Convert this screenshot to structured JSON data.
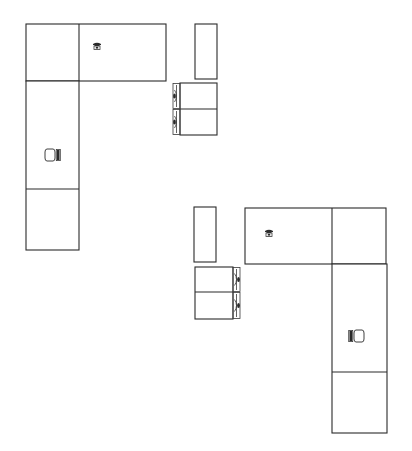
{
  "diagram": {
    "type": "office-floor-plan",
    "canvas": {
      "width": 412,
      "height": 451,
      "background": "#ffffff",
      "line_color": "#2b2b2b"
    },
    "workstations": [
      {
        "id": "workstation-1",
        "desk_top": {
          "x": 26,
          "y": 24,
          "w": 140,
          "h": 57,
          "divider_x": 79
        },
        "desk_side": {
          "x": 26,
          "y": 81,
          "w": 53,
          "h": 169,
          "divider_y": 189
        },
        "phone": {
          "x": 97,
          "y": 46
        },
        "chair": {
          "x": 52,
          "y": 155,
          "facing": "right"
        },
        "storage_tall": {
          "x": 195,
          "y": 24,
          "w": 22,
          "h": 55
        },
        "file_cabinet": {
          "x": 180,
          "y": 83,
          "w": 37,
          "h": 52,
          "divider_y": 109,
          "handles_side": "left",
          "drawer_count": 2
        }
      },
      {
        "id": "workstation-2",
        "desk_top": {
          "x": 245,
          "y": 208,
          "w": 141,
          "h": 56,
          "divider_x": 332
        },
        "desk_side": {
          "x": 332,
          "y": 264,
          "w": 55,
          "h": 169,
          "divider_y": 372
        },
        "phone": {
          "x": 269,
          "y": 233
        },
        "chair": {
          "x": 357,
          "y": 336,
          "facing": "left"
        },
        "storage_tall": {
          "x": 194,
          "y": 207,
          "w": 22,
          "h": 55
        },
        "file_cabinet": {
          "x": 195,
          "y": 267,
          "w": 38,
          "h": 52,
          "divider_y": 292,
          "handles_side": "right",
          "drawer_count": 2
        }
      }
    ],
    "icons": {
      "phone": "telephone-icon",
      "chair": "office-chair-icon",
      "drawer_handle": "drawer-handle-icon"
    }
  }
}
